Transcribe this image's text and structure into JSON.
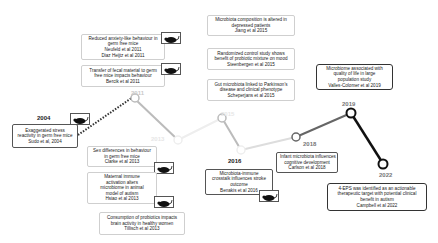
{
  "timeline": {
    "years": [
      {
        "label": "2004",
        "x": 12,
        "y": 112,
        "style": "dark"
      },
      {
        "label": "2011",
        "x": 131,
        "y": 89,
        "style": "faint"
      },
      {
        "label": "2013",
        "x": 151,
        "y": 138,
        "style": "vfaint"
      },
      {
        "label": "2015",
        "x": 221,
        "y": 101,
        "style": "vfaint"
      },
      {
        "label": "2016",
        "x": 228,
        "y": 159,
        "style": "dark"
      },
      {
        "label": "2018",
        "x": 303,
        "y": 142,
        "style": "mid"
      },
      {
        "label": "2019",
        "x": 342,
        "y": 100,
        "style": "dark"
      },
      {
        "label": "2022",
        "x": 380,
        "y": 173,
        "style": "dark"
      }
    ],
    "line_colors": {
      "dotted": "#333333",
      "segment_2011_2013": "#bbbbbb",
      "segment_2013_2015": "#eeeeee",
      "segment_2015_2016": "#bbbbbb",
      "segment_2016_2018": "#dddddd",
      "segment_2018_2019": "#666666",
      "segment_2019_2022": "#111111"
    }
  },
  "events": [
    {
      "id": "e2004",
      "lines": [
        "Exaggerated stress",
        "reactivity in germ free mice",
        "Sudo et al, 2004"
      ],
      "mouse": true
    },
    {
      "id": "e2011a",
      "lines": [
        "Reduced anxiety-like behaviour in",
        "germ free mice",
        "Neufeld et al 2011",
        "Diaz Heijtz et al 2011"
      ],
      "mouse": true
    },
    {
      "id": "e2011b",
      "lines": [
        "Transfer of fecal material to germ",
        "free mice impacts behaviour",
        "Bercik et al 2011"
      ],
      "mouse": true
    },
    {
      "id": "e2013a",
      "lines": [
        "Sex differences in behaviour",
        "in germ free mice",
        "Clarke et al 2013"
      ],
      "mouse": true
    },
    {
      "id": "e2013b",
      "lines": [
        "Maternal immune",
        "activation alters",
        "microbiome in animal",
        "model of autism",
        "Hsiao et al 2013"
      ],
      "mouse": true
    },
    {
      "id": "e2013c",
      "lines": [
        "Consumption of probiotics impacts",
        "brain activity in healthy women",
        "Tillisch et al 2013"
      ],
      "mouse": false
    },
    {
      "id": "e2015a",
      "lines": [
        "Microbiota composition is altered in",
        "depressed patients",
        "Jiang et al 2015"
      ],
      "mouse": false
    },
    {
      "id": "e2015b",
      "lines": [
        "Randomized control study shows",
        "benefit of probiotic mixture on mood",
        "Steenbergen et al 2015"
      ],
      "mouse": false
    },
    {
      "id": "e2015c",
      "lines": [
        "Gut microbiota linked to Parkinson's",
        "disease and clinical phenotype",
        "Scheperjans et al 2015"
      ],
      "mouse": false
    },
    {
      "id": "e2016",
      "lines": [
        "Microbiota-immune",
        "crosstalk influences stroke",
        "outcome",
        "Benakis et al 2016"
      ],
      "mouse": true
    },
    {
      "id": "e2018",
      "lines": [
        "Infant microbiota influences",
        "cognitive development",
        "Carlson et al 2018"
      ],
      "mouse": false
    },
    {
      "id": "e2019",
      "lines": [
        "Microbiome associated with",
        "quality of life in large",
        "population study",
        "Valles-Colomer et al 2019"
      ],
      "mouse": false
    },
    {
      "id": "e2022",
      "lines": [
        "4-EPS was identified as an actionable",
        "therapeutic target with potential clinical",
        "benefit in autism",
        "Campbell et al 2022"
      ],
      "mouse": false
    }
  ],
  "icons": {
    "mouse": "mouse-icon"
  }
}
